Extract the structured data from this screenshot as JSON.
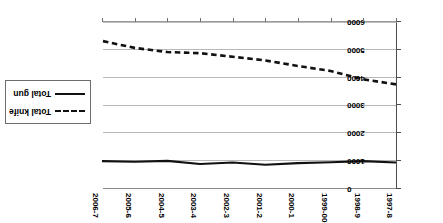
{
  "chart_data": {
    "type": "line",
    "title": "",
    "subtitle": "",
    "xlabel": "",
    "ylabel": "",
    "grid": true,
    "legend_position": "middle-left",
    "categories": [
      "1997-8",
      "1998-9",
      "1999-00",
      "2000-1",
      "2001-2",
      "2002-3",
      "2003-4",
      "2004-5",
      "2005-6",
      "2006-7"
    ],
    "ylim": [
      0,
      6000
    ],
    "yticks": [
      0,
      1000,
      2000,
      3000,
      4000,
      5000,
      6000
    ],
    "ytick_labels": [
      "0",
      "1000",
      "2000",
      "3000",
      "4000",
      "5000",
      "6000"
    ],
    "y_axis_inverted_display": false,
    "series": [
      {
        "name": "Total gun",
        "style": "solid",
        "color": "#111111",
        "values": [
          950,
          1000,
          960,
          930,
          870,
          950,
          900,
          1010,
          980,
          1000
        ]
      },
      {
        "name": "Total knife",
        "style": "dashed",
        "color": "#111111",
        "values": [
          3760,
          3940,
          4240,
          4420,
          4620,
          4750,
          4880,
          4920,
          5070,
          5320
        ]
      }
    ],
    "legend": [
      {
        "label": "Total knife",
        "style": "dashed"
      },
      {
        "label": "Total gun",
        "style": "solid"
      }
    ]
  }
}
